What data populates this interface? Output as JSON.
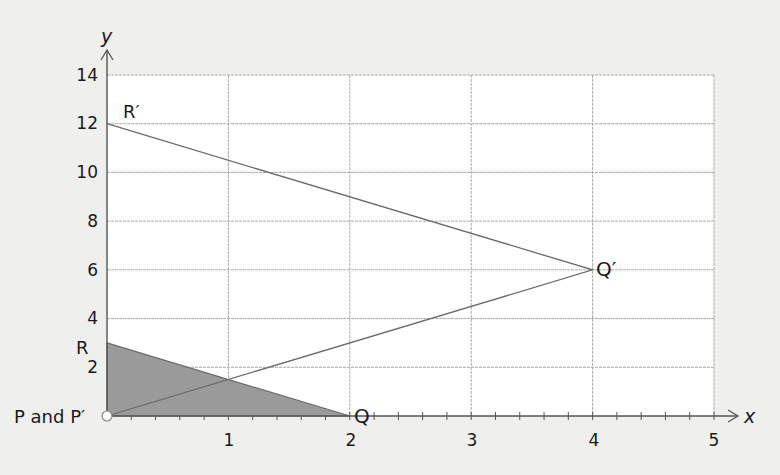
{
  "chart_data": {
    "type": "scatter",
    "title": "",
    "xlabel": "x",
    "ylabel": "y",
    "xlim": [
      0,
      5
    ],
    "ylim": [
      0,
      14
    ],
    "grid": true,
    "x_ticks": [
      1,
      2,
      3,
      4,
      5
    ],
    "y_ticks": [
      2,
      4,
      6,
      8,
      10,
      12,
      14
    ],
    "x_minor_tick_step": 0.2,
    "shapes": [
      {
        "name": "triangle PQR",
        "filled": true,
        "fill_color": "#9a9a9a",
        "vertices": [
          {
            "label": "P",
            "x": 0,
            "y": 0
          },
          {
            "label": "Q",
            "x": 2,
            "y": 0
          },
          {
            "label": "R",
            "x": 0,
            "y": 3
          }
        ]
      },
      {
        "name": "triangle P'Q'R'",
        "filled": false,
        "vertices": [
          {
            "label": "P'",
            "x": 0,
            "y": 0
          },
          {
            "label": "Q'",
            "x": 4,
            "y": 6
          },
          {
            "label": "R'",
            "x": 0,
            "y": 12
          }
        ]
      }
    ],
    "annotations": [
      {
        "text": "P and P'",
        "x": 0,
        "y": 0
      },
      {
        "text": "Q",
        "x": 2,
        "y": 0
      },
      {
        "text": "R",
        "x": 0,
        "y": 3
      },
      {
        "text": "Q'",
        "x": 4,
        "y": 6
      },
      {
        "text": "R'",
        "x": 0,
        "y": 12
      }
    ]
  },
  "labels": {
    "x_axis": "x",
    "y_axis": "y",
    "x_ticks": [
      "1",
      "2",
      "3",
      "4",
      "5"
    ],
    "y_ticks": [
      "2",
      "4",
      "6",
      "8",
      "10",
      "12",
      "14"
    ],
    "p_and_p_prime": "P and P′",
    "q": "Q",
    "r": "R",
    "q_prime": "Q′",
    "r_prime": "R′"
  },
  "colors": {
    "background": "#efefed",
    "plot_area": "#ffffff",
    "grid": "#a8a8a8",
    "axis": "#555555",
    "line": "#6a6a6a",
    "fill": "#9a9a9a"
  }
}
